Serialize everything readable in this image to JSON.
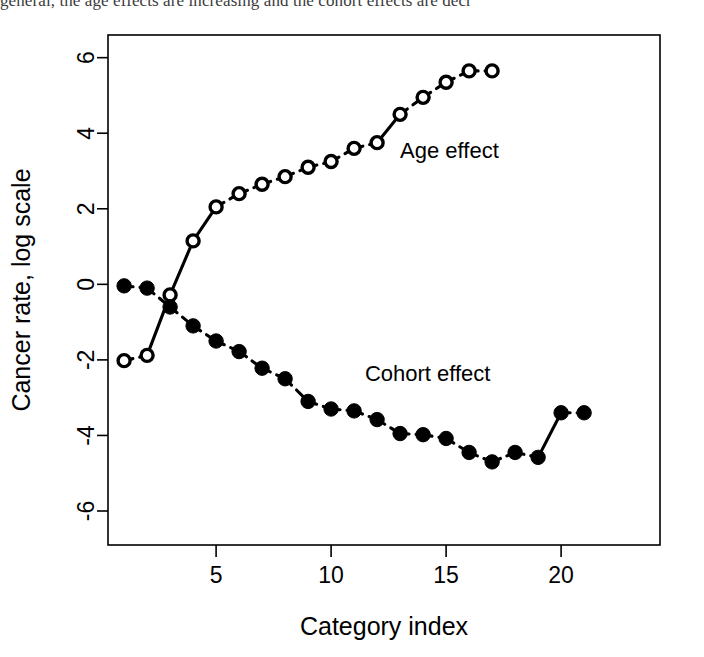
{
  "page": {
    "running_text": "general, the age effects are increasing and the cohort effects are decr"
  },
  "chart_data": {
    "type": "line",
    "title": "",
    "xlabel": "Category index",
    "ylabel": "Cancer rate, log scale",
    "xlim": [
      0.3,
      24.3
    ],
    "ylim": [
      -6.9,
      6.6
    ],
    "xticks": [
      5,
      10,
      15,
      20
    ],
    "yticks": [
      -6,
      -4,
      -2,
      0,
      2,
      4,
      6
    ],
    "xtick_labels": [
      "5",
      "10",
      "15",
      "20"
    ],
    "ytick_labels": [
      "-6",
      "-4",
      "-2",
      "0",
      "2",
      "4",
      "6"
    ],
    "grid": false,
    "legend_position": "inline-annotation",
    "frame": "box",
    "series": [
      {
        "name": "Age effect",
        "marker": "open-circle",
        "linestyle": "dashed",
        "annotation": "Age effect",
        "annotation_x": 13.0,
        "annotation_y": 3.35,
        "x": [
          1,
          2,
          3,
          4,
          5,
          6,
          7,
          8,
          9,
          10,
          11,
          12,
          13,
          14,
          15,
          16,
          17
        ],
        "values": [
          -2.02,
          -1.88,
          -0.28,
          1.15,
          2.05,
          2.4,
          2.65,
          2.85,
          3.1,
          3.25,
          3.6,
          3.75,
          4.5,
          4.95,
          5.35,
          5.65,
          5.65
        ]
      },
      {
        "name": "Cohort effect",
        "marker": "filled-circle",
        "linestyle": "dashed",
        "annotation": "Cohort effect",
        "annotation_x": 14.2,
        "annotation_y": -2.55,
        "x": [
          1,
          2,
          3,
          4,
          5,
          6,
          7,
          8,
          9,
          10,
          11,
          12,
          13,
          14,
          15,
          16,
          17,
          18,
          19,
          20,
          21
        ],
        "values": [
          -0.04,
          -0.1,
          -0.6,
          -1.1,
          -1.5,
          -1.78,
          -2.22,
          -2.5,
          -3.1,
          -3.3,
          -3.35,
          -3.58,
          -3.95,
          -3.98,
          -4.08,
          -4.45,
          -4.7,
          -4.45,
          -4.58,
          -3.4,
          -3.4
        ]
      }
    ]
  }
}
